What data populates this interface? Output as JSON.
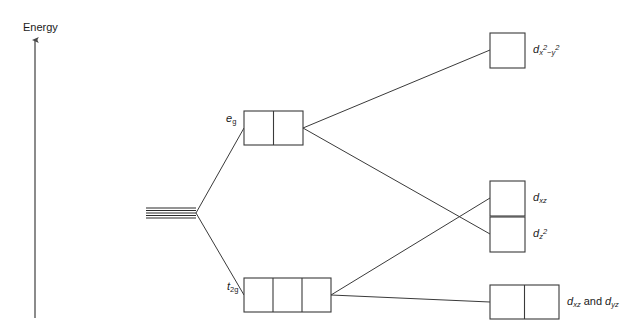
{
  "diagram": {
    "axis": {
      "label": "Energy",
      "direction": "up",
      "icon": "up-arrow-icon"
    },
    "colors": {
      "stroke": "#3a3a3a",
      "box_stroke": "#3a3a3a",
      "text": "#1a1a1a",
      "background": "#ffffff"
    },
    "free_ion": {
      "name": "degenerate-d-levels",
      "line_count": 5
    },
    "split_levels": [
      {
        "id": "eg",
        "label_d": "e",
        "label_sub": "g",
        "cells": 2
      },
      {
        "id": "t2g",
        "label_d": "t",
        "label_sub": "2g",
        "cells": 3
      }
    ],
    "orbitals": [
      {
        "id": "dx2-y2",
        "d": "d",
        "sub_pre": "x",
        "sup_pre": "2",
        "minus": "−",
        "sub_post": "y",
        "sup_post": "2",
        "text": "d x2−y2",
        "cells": 1
      },
      {
        "id": "dxz-upper",
        "d": "d",
        "sub": "xz",
        "text": "d xz",
        "cells": 1
      },
      {
        "id": "dz2",
        "d": "d",
        "sub": "z",
        "sup": "2",
        "text": "d z2",
        "cells": 1
      },
      {
        "id": "dxz-dyz",
        "d1": "d",
        "sub1": "xz",
        "conj": "and",
        "d2": "d",
        "sub2": "yz",
        "text": "d xz and d yz",
        "cells": 2
      }
    ]
  }
}
